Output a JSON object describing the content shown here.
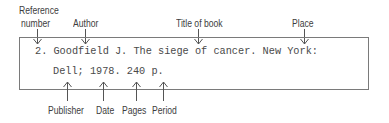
{
  "citation": {
    "line1": "2. Goodfield J. The siege of cancer. New York:",
    "line2": "Dell; 1978. 240 p."
  },
  "top_labels": [
    {
      "id": "reference-number",
      "line1": "Reference",
      "line2": "number"
    },
    {
      "id": "author",
      "text": "Author"
    },
    {
      "id": "title-of-book",
      "text": "Title of book"
    },
    {
      "id": "place",
      "text": "Place"
    }
  ],
  "bottom_labels": [
    {
      "id": "publisher",
      "text": "Publisher"
    },
    {
      "id": "date",
      "text": "Date"
    },
    {
      "id": "pages",
      "text": "Pages"
    },
    {
      "id": "period",
      "text": "Period"
    }
  ],
  "colors": {
    "label_text": "#3d3d3d",
    "citation_text": "#4a4a4a",
    "border": "#7a7a7a",
    "arrow": "#555555"
  }
}
